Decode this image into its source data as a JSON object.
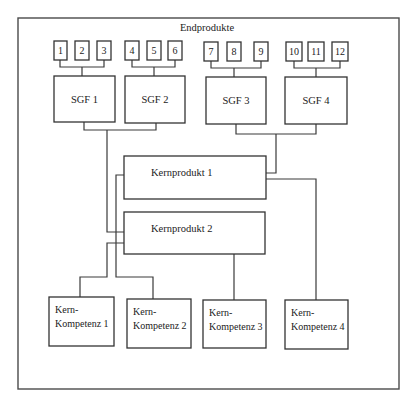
{
  "diagram": {
    "title": "Endprodukte",
    "colors": {
      "stroke": "#333333",
      "background": "#ffffff",
      "text": "#222222"
    },
    "frame": {
      "x": 18,
      "y": 18,
      "w": 381,
      "h": 371
    },
    "end_products": [
      {
        "label": "1",
        "x": 54,
        "y": 41,
        "w": 13,
        "h": 19
      },
      {
        "label": "2",
        "x": 75,
        "y": 41,
        "w": 14,
        "h": 19
      },
      {
        "label": "3",
        "x": 97,
        "y": 41,
        "w": 14,
        "h": 19
      },
      {
        "label": "4",
        "x": 125,
        "y": 41,
        "w": 14,
        "h": 19
      },
      {
        "label": "5",
        "x": 147,
        "y": 41,
        "w": 14,
        "h": 19
      },
      {
        "label": "6",
        "x": 168,
        "y": 41,
        "w": 14,
        "h": 19
      },
      {
        "label": "7",
        "x": 204,
        "y": 42,
        "w": 14,
        "h": 19
      },
      {
        "label": "8",
        "x": 227,
        "y": 42,
        "w": 14,
        "h": 19
      },
      {
        "label": "9",
        "x": 254,
        "y": 42,
        "w": 14,
        "h": 19
      },
      {
        "label": "10",
        "x": 286,
        "y": 42,
        "w": 16,
        "h": 19
      },
      {
        "label": "11",
        "x": 308,
        "y": 42,
        "w": 16,
        "h": 19
      },
      {
        "label": "12",
        "x": 332,
        "y": 42,
        "w": 16,
        "h": 19
      }
    ],
    "sgf": [
      {
        "label": "SGF 1",
        "x": 54,
        "y": 76,
        "w": 61,
        "h": 46
      },
      {
        "label": "SGF 2",
        "x": 125,
        "y": 76,
        "w": 60,
        "h": 47
      },
      {
        "label": "SGF 3",
        "x": 206,
        "y": 77,
        "w": 60,
        "h": 47
      },
      {
        "label": "SGF 4",
        "x": 285,
        "y": 77,
        "w": 62,
        "h": 47
      }
    ],
    "core_products": [
      {
        "label": "Kernprodukt 1",
        "x": 124,
        "y": 156,
        "w": 142,
        "h": 43
      },
      {
        "label": "Kernprodukt 2",
        "x": 124,
        "y": 212,
        "w": 141,
        "h": 42
      }
    ],
    "core_competencies": [
      {
        "line1": "Kern-",
        "line2": "Kompetenz 1",
        "x": 49,
        "y": 297,
        "w": 65,
        "h": 49
      },
      {
        "line1": "Kern-",
        "line2": "Kompetenz 2",
        "x": 127,
        "y": 299,
        "w": 64,
        "h": 49
      },
      {
        "line1": "Kern-",
        "line2": "Kompetenz 3",
        "x": 203,
        "y": 300,
        "w": 63,
        "h": 48
      },
      {
        "line1": "Kern-",
        "line2": "Kompetenz 4",
        "x": 285,
        "y": 300,
        "w": 63,
        "h": 49
      }
    ],
    "connectors": [
      "M60,60 V67 H104 V60 M82,67 V76",
      "M132,60 V67 H175 V60 M154,67 V76",
      "M211,61 V68 H261 V61 M234,68 V77",
      "M294,61 V68 H340 V61 M316,68 V77",
      "M84,122 V130 H156 V123 M107,130 V232 H124",
      "M236,124 V134 H316 V124 M276,134 V173 H266",
      "M124,175 H116 V277 H153 V299",
      "M124,243 H107 V277 H80 V297",
      "M234,254 V300",
      "M266,179 H316 V300"
    ]
  }
}
